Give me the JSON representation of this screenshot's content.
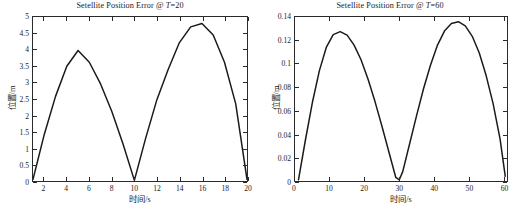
{
  "figure": {
    "width": 520,
    "height": 209,
    "background": "#ffffff",
    "line_color": "#1a1a1a",
    "axis_color": "#2b2b2b"
  },
  "charts": [
    {
      "id": "left",
      "title_main": "Setellite Position Error @ ",
      "title_var": "T",
      "title_tail": "=20",
      "xlabel": "时间/s",
      "ylabel": "位置/m",
      "xticks": [
        2,
        4,
        6,
        8,
        10,
        12,
        14,
        16,
        18,
        20
      ],
      "xticklabels": [
        "2",
        "4",
        "6",
        "8",
        "10",
        "12",
        "14",
        "16",
        "18",
        "20"
      ],
      "yticks": [
        0,
        0.5,
        1,
        1.5,
        2,
        2.5,
        3,
        3.5,
        4,
        4.5,
        5
      ],
      "yticklabels": [
        "0",
        "0.5",
        "1",
        "1.5",
        "2",
        "2.5",
        "3",
        "3.5",
        "4",
        "4.5",
        "5"
      ],
      "xlim": [
        1,
        20
      ],
      "ylim": [
        0,
        5
      ],
      "grid": false,
      "legend": "none"
    },
    {
      "id": "right",
      "title_main": "Setellite Position Error @ ",
      "title_var": "T",
      "title_tail": "=60",
      "xlabel": "时间/s",
      "ylabel": "位置/m",
      "xticks": [
        0,
        10,
        20,
        30,
        40,
        50,
        60
      ],
      "xticklabels": [
        "0",
        "10",
        "20",
        "30",
        "40",
        "50",
        "60"
      ],
      "yticks": [
        0,
        0.02,
        0.04,
        0.06,
        0.08,
        0.1,
        0.12,
        0.14
      ],
      "yticklabels": [
        "0",
        "0.02",
        "0.04",
        "0.06",
        "0.08",
        "0.1",
        "0.12",
        "0.14"
      ],
      "xlim": [
        0,
        61
      ],
      "ylim": [
        0,
        0.14
      ],
      "grid": false,
      "legend": "none"
    }
  ],
  "chart_data": [
    {
      "type": "line",
      "title": "Setellite Position Error @ T=20",
      "xlabel": "时间/s",
      "ylabel": "位置/m",
      "xlim": [
        1,
        20
      ],
      "ylim": [
        0,
        5
      ],
      "grid": false,
      "legend": "none",
      "series": [
        {
          "name": "position error",
          "x": [
            1,
            2,
            3,
            4,
            5,
            6,
            7,
            8,
            9,
            10,
            11,
            12,
            13,
            14,
            15,
            16,
            17,
            18,
            19,
            20
          ],
          "y": [
            0.05,
            1.42,
            2.58,
            3.5,
            3.98,
            3.62,
            2.96,
            2.12,
            1.12,
            0.02,
            1.3,
            2.48,
            3.4,
            4.22,
            4.7,
            4.8,
            4.45,
            3.62,
            2.35,
            0.05
          ]
        }
      ]
    },
    {
      "type": "line",
      "title": "Setellite Position Error @ T=60",
      "xlabel": "时间/s",
      "ylabel": "位置/m",
      "xlim": [
        0,
        61
      ],
      "ylim": [
        0,
        0.14
      ],
      "grid": false,
      "legend": "none",
      "series": [
        {
          "name": "position error",
          "x": [
            1,
            3,
            5,
            7,
            9,
            11,
            13,
            15,
            17,
            19,
            21,
            23,
            25,
            27,
            29,
            30,
            31,
            33,
            35,
            37,
            39,
            41,
            43,
            45,
            47,
            49,
            51,
            53,
            55,
            57,
            59,
            60.5
          ],
          "y": [
            0.001,
            0.035,
            0.067,
            0.094,
            0.114,
            0.125,
            0.1275,
            0.1245,
            0.116,
            0.1035,
            0.087,
            0.068,
            0.047,
            0.025,
            0.003,
            0.001,
            0.008,
            0.032,
            0.056,
            0.079,
            0.099,
            0.116,
            0.128,
            0.1345,
            0.136,
            0.1325,
            0.1235,
            0.1095,
            0.09,
            0.066,
            0.036,
            0.004
          ]
        }
      ]
    }
  ]
}
